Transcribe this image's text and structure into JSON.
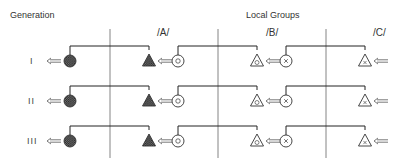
{
  "header": {
    "generation_label": "Generation",
    "local_groups_label": "Local Groups"
  },
  "groups": [
    {
      "label": "/A/"
    },
    {
      "label": "/B/"
    },
    {
      "label": "/C/"
    }
  ],
  "generations": [
    {
      "label": "I"
    },
    {
      "label": "II"
    },
    {
      "label": "III"
    }
  ],
  "symbols": {
    "origin": "hatched-circle",
    "group_a": {
      "triangle": "hatched-triangle",
      "circle": "dotted-circle"
    },
    "group_b": {
      "triangle": "dotted-triangle",
      "circle": "cross-circle"
    },
    "group_c": {
      "triangle": "cross-triangle"
    }
  },
  "arrow_glyph": "<=="
}
